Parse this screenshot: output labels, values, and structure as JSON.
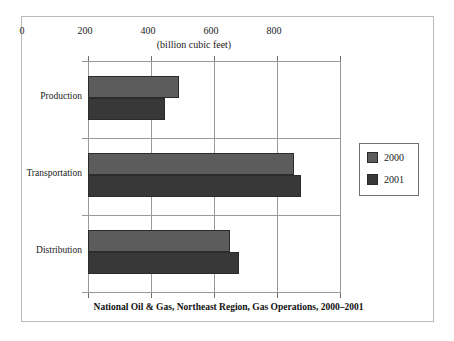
{
  "chart_data": {
    "type": "bar",
    "orientation": "horizontal",
    "title": "National Oil & Gas, Northeast Region, Gas Operations, 2000–2001",
    "xlabel": "(billion cubic feet)",
    "ylabel": "",
    "xlim": [
      0,
      800
    ],
    "xticks": [
      0,
      200,
      400,
      600,
      800
    ],
    "xtick_labels": [
      "0",
      "200",
      "400",
      "600",
      "800"
    ],
    "grid": true,
    "legend_position": "right",
    "categories": [
      "Production",
      "Transportation",
      "Distribution"
    ],
    "series": [
      {
        "name": "2000",
        "color": "#5c5c5c",
        "values": [
          290,
          655,
          450
        ]
      },
      {
        "name": "2001",
        "color": "#383838",
        "values": [
          243,
          675,
          478
        ]
      }
    ]
  },
  "legend": {
    "entries": [
      {
        "label": "2000"
      },
      {
        "label": "2001"
      }
    ]
  },
  "caption": {
    "text": "National Oil & Gas, Northeast Region, Gas Operations, 2000–2001"
  },
  "axis": {
    "subtitle": "(billion cubic feet)",
    "tick_labels": [
      "0",
      "200",
      "400",
      "600",
      "800"
    ]
  }
}
